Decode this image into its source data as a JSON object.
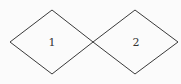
{
  "diagram": {
    "shapes": [
      {
        "type": "rhombus",
        "label": "1",
        "points": [
          [
            10,
            42
          ],
          [
            52,
            10
          ],
          [
            93,
            42
          ],
          [
            52,
            74
          ]
        ]
      },
      {
        "type": "rhombus",
        "label": "2",
        "points": [
          [
            93,
            42
          ],
          [
            135,
            10
          ],
          [
            178,
            42
          ],
          [
            135,
            74
          ]
        ]
      }
    ],
    "stroke_color": "#3a3a3a",
    "background_color": "#fbfbfb"
  }
}
